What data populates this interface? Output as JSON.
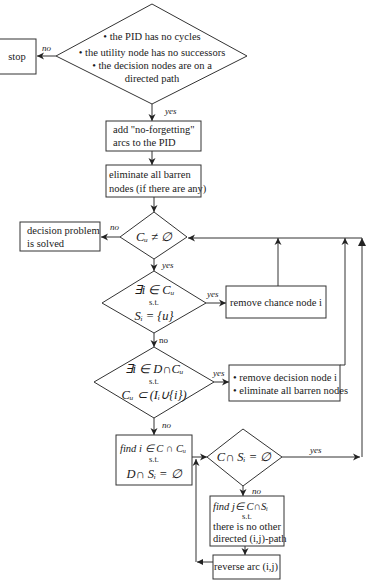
{
  "diagram": {
    "type": "flowchart",
    "nodes": {
      "check_pid": {
        "shape": "diamond",
        "lines": [
          "• the PID has no cycles",
          "• the utility node has no successors",
          "• the decision nodes are on a",
          "directed path"
        ]
      },
      "stop": {
        "shape": "box",
        "label": "stop"
      },
      "add_arcs": {
        "shape": "box",
        "lines": [
          "add \"no-forgetting\"",
          "arcs to the PID"
        ]
      },
      "eliminate_barren": {
        "shape": "box",
        "lines": [
          "eliminate all barren",
          "nodes (if there are any)"
        ]
      },
      "cu_nonempty": {
        "shape": "diamond",
        "label": "Cᵤ ≠ ∅"
      },
      "solved": {
        "shape": "box",
        "lines": [
          "decision problem",
          "is solved"
        ]
      },
      "chance_check": {
        "shape": "diamond",
        "lines": [
          "∃i ∈ Cᵤ",
          "s.t.",
          "Sᵢ = {u}"
        ]
      },
      "remove_chance": {
        "shape": "box",
        "label": "remove chance node i"
      },
      "decision_check": {
        "shape": "diamond",
        "lines": [
          "∃i ∈ D∩Cᵤ",
          "s.t.",
          "Cᵤ ⊂ (Iᵢ∪{i})"
        ]
      },
      "remove_decision": {
        "shape": "box",
        "lines": [
          "• remove decision node i",
          "• eliminate all barren nodes"
        ]
      },
      "find_i": {
        "shape": "box",
        "lines": [
          "find  i ∈ C ∩ Cᵤ",
          "s.t.",
          "D∩ Sᵢ = ∅"
        ]
      },
      "c_si_empty": {
        "shape": "diamond",
        "label": "C∩ Sᵢ = ∅"
      },
      "find_j": {
        "shape": "box",
        "lines": [
          "find  j∈ C∩Sᵢ",
          "s.t.",
          "there is no other",
          "directed (i,j)-path"
        ]
      },
      "reverse_arc": {
        "shape": "box",
        "label": "reverse arc (i,j)"
      }
    },
    "edge_labels": {
      "no": "no",
      "yes": "yes"
    },
    "edges": [
      {
        "from": "check_pid",
        "to": "stop",
        "label": "no"
      },
      {
        "from": "check_pid",
        "to": "add_arcs",
        "label": "yes"
      },
      {
        "from": "add_arcs",
        "to": "eliminate_barren"
      },
      {
        "from": "eliminate_barren",
        "to": "cu_nonempty"
      },
      {
        "from": "cu_nonempty",
        "to": "solved",
        "label": "no"
      },
      {
        "from": "cu_nonempty",
        "to": "chance_check",
        "label": "yes"
      },
      {
        "from": "chance_check",
        "to": "remove_chance",
        "label": "yes"
      },
      {
        "from": "chance_check",
        "to": "decision_check",
        "label": "no"
      },
      {
        "from": "remove_chance",
        "to": "cu_nonempty"
      },
      {
        "from": "decision_check",
        "to": "remove_decision",
        "label": "yes"
      },
      {
        "from": "decision_check",
        "to": "find_i",
        "label": "no"
      },
      {
        "from": "remove_decision",
        "to": "cu_nonempty"
      },
      {
        "from": "find_i",
        "to": "c_si_empty"
      },
      {
        "from": "c_si_empty",
        "to": "cu_nonempty",
        "label": "yes"
      },
      {
        "from": "c_si_empty",
        "to": "find_j",
        "label": "no"
      },
      {
        "from": "find_j",
        "to": "reverse_arc"
      },
      {
        "from": "reverse_arc",
        "to": "c_si_empty"
      }
    ]
  }
}
